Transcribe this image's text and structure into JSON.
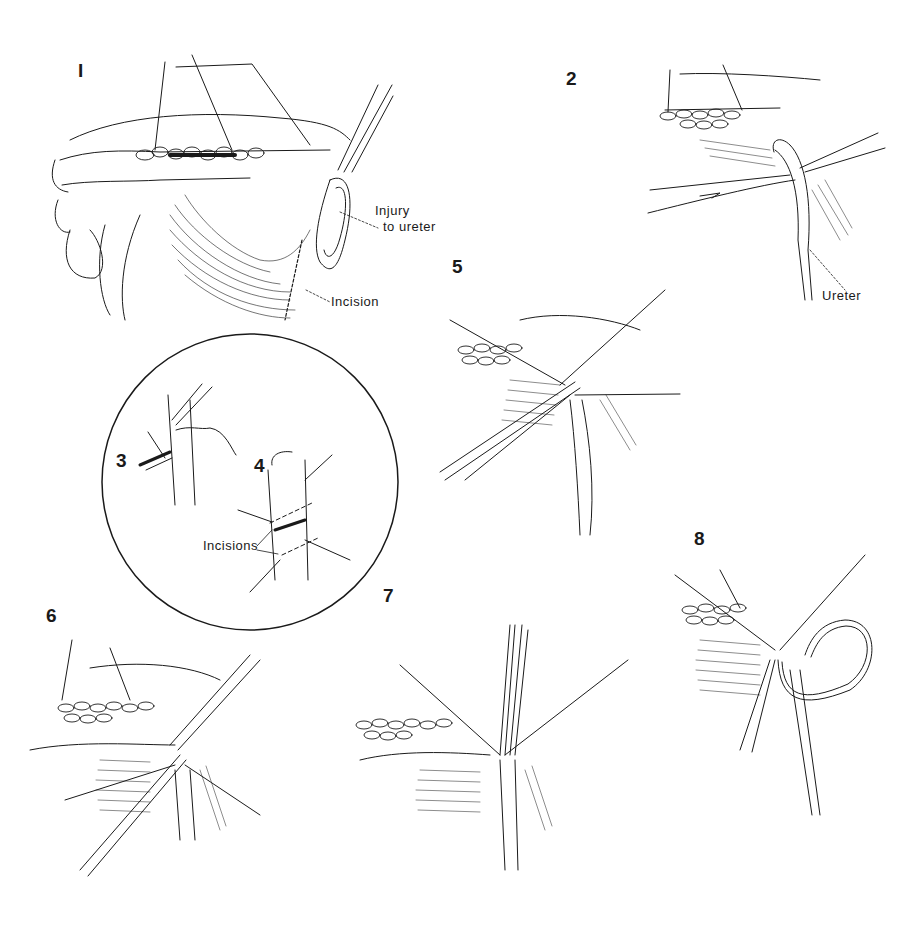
{
  "figure": {
    "type": "surgical-illustration-sequence",
    "panels": [
      {
        "number": "1",
        "annotations": [
          "Injury to ureter",
          "Incision"
        ]
      },
      {
        "number": "2",
        "annotations": [
          "Ureter"
        ]
      },
      {
        "number": "3",
        "annotations": []
      },
      {
        "number": "4",
        "annotations": [
          "Incisions"
        ]
      },
      {
        "number": "5",
        "annotations": []
      },
      {
        "number": "6",
        "annotations": []
      },
      {
        "number": "7",
        "annotations": []
      },
      {
        "number": "8",
        "annotations": []
      }
    ]
  },
  "labels": {
    "p1": "I",
    "p2": "2",
    "p3": "3",
    "p4": "4",
    "p5": "5",
    "p6": "6",
    "p7": "7",
    "p8": "8",
    "injury_line1": "Injury",
    "injury_line2": "to ureter",
    "incision": "Incision",
    "ureter": "Ureter",
    "incisions": "Incisions"
  },
  "colors": {
    "ink": "#1a1a1a",
    "background": "#ffffff"
  }
}
